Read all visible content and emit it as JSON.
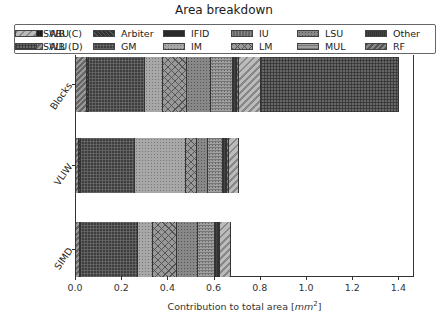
{
  "chart_data": {
    "type": "bar",
    "orientation": "horizontal",
    "stacked": true,
    "title": "Area breakdown",
    "xlabel": "Contribution to total area [mm²]",
    "ylabel": "",
    "xlim": [
      0.0,
      1.46
    ],
    "xticks": [
      "0.0",
      "0.2",
      "0.4",
      "0.6",
      "0.8",
      "1.0",
      "1.2",
      "1.4"
    ],
    "categories": [
      "Blocks",
      "VLIW",
      "SIMD"
    ],
    "legend_position": "top (above plot, 6 columns)",
    "grid": false,
    "series": [
      {
        "name": "ABU",
        "values": [
          0.0,
          0.0,
          0.0
        ]
      },
      {
        "name": "ALU",
        "values": [
          0.048,
          0.013,
          0.017
        ]
      },
      {
        "name": "Arbiter",
        "values": [
          0.009,
          0.009,
          0.004
        ]
      },
      {
        "name": "GM",
        "values": [
          0.242,
          0.234,
          0.247
        ]
      },
      {
        "name": "IFID",
        "values": [
          0.0,
          0.0,
          0.0
        ]
      },
      {
        "name": "IM",
        "values": [
          0.078,
          0.221,
          0.065
        ]
      },
      {
        "name": "IU",
        "values": [
          0.0,
          0.0,
          0.0
        ]
      },
      {
        "name": "LM",
        "values": [
          0.104,
          0.048,
          0.104
        ]
      },
      {
        "name": "LSU",
        "values": [
          0.104,
          0.048,
          0.091
        ]
      },
      {
        "name": "MUL",
        "values": [
          0.095,
          0.065,
          0.074
        ]
      },
      {
        "name": "Other",
        "values": [
          0.017,
          0.017,
          0.017
        ]
      },
      {
        "name": "RF",
        "values": [
          0.009,
          0.009,
          0.004
        ]
      },
      {
        "name": "SWB (C)",
        "values": [
          0.095,
          0.043,
          0.048
        ]
      },
      {
        "name": "SWB (D)",
        "values": [
          0.597,
          0.0,
          0.0
        ]
      }
    ],
    "totals": [
      1.4,
      0.71,
      0.67
    ]
  },
  "legend": {
    "items": [
      {
        "label": "ABU",
        "pattern": "ABU"
      },
      {
        "label": "ALU",
        "pattern": "ALU"
      },
      {
        "label": "Arbiter",
        "pattern": "Arbiter"
      },
      {
        "label": "GM",
        "pattern": "GM"
      },
      {
        "label": "IFID",
        "pattern": "IFID"
      },
      {
        "label": "IM",
        "pattern": "IM"
      },
      {
        "label": "IU",
        "pattern": "IU"
      },
      {
        "label": "LM",
        "pattern": "LM"
      },
      {
        "label": "LSU",
        "pattern": "LSU"
      },
      {
        "label": "MUL",
        "pattern": "MUL"
      },
      {
        "label": "Other",
        "pattern": "Other"
      },
      {
        "label": "RF",
        "pattern": "RF"
      },
      {
        "label": "SWB (C)",
        "pattern": "SWBC"
      },
      {
        "label": "SWB (D)",
        "pattern": "SWBD"
      }
    ]
  }
}
